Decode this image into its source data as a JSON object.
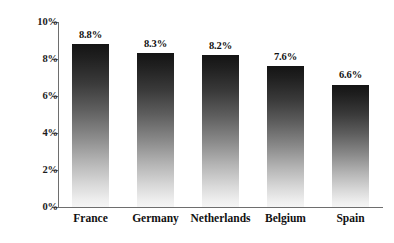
{
  "chart_data": {
    "type": "bar",
    "title": "",
    "subtitle": "",
    "xlabel": "",
    "ylabel": "",
    "categories": [
      "France",
      "Germany",
      "Netherlands",
      "Belgium",
      "Spain"
    ],
    "values": [
      8.8,
      8.3,
      8.2,
      7.6,
      6.6
    ],
    "value_labels": [
      "8.8%",
      "8.3%",
      "8.2%",
      "7.6%",
      "6.6%"
    ],
    "ylim": [
      0,
      10
    ],
    "ytick_values": [
      0,
      2,
      4,
      6,
      8,
      10
    ],
    "ytick_labels": [
      "0%",
      "2%",
      "4%",
      "6%",
      "8%",
      "10%"
    ],
    "grid": false,
    "legend": false,
    "legend_position": "none",
    "bar_gradient_top": "#141414",
    "bar_gradient_bottom": "#f5f5f5",
    "axis_color": "#6e6e6e",
    "text_color": "#111111",
    "background": "#ffffff"
  }
}
